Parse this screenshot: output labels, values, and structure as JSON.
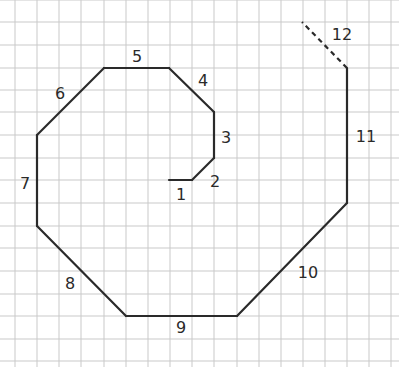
{
  "diagram": {
    "type": "spiral-path-on-grid",
    "grid": {
      "x_lines": [
        15,
        37,
        59,
        81,
        104,
        126,
        148,
        170,
        192,
        214,
        237,
        259,
        281,
        303,
        325,
        347,
        369,
        391
      ],
      "y_lines": [
        0,
        22,
        45,
        68,
        90,
        112,
        135,
        158,
        180,
        203,
        226,
        248,
        271,
        294,
        316,
        339,
        361
      ],
      "color": "#c9c9c9"
    },
    "line_color": "#2a2a2a",
    "segments": [
      {
        "label": "1",
        "from": [
          169,
          180
        ],
        "to": [
          192,
          180
        ],
        "dashed": false,
        "label_pos": [
          181,
          195
        ]
      },
      {
        "label": "2",
        "from": [
          192,
          180
        ],
        "to": [
          214,
          158
        ],
        "dashed": false,
        "label_pos": [
          215,
          182
        ]
      },
      {
        "label": "3",
        "from": [
          214,
          158
        ],
        "to": [
          214,
          112
        ],
        "dashed": false,
        "label_pos": [
          226,
          138
        ]
      },
      {
        "label": "4",
        "from": [
          214,
          112
        ],
        "to": [
          169,
          68
        ],
        "dashed": false,
        "label_pos": [
          203,
          81
        ]
      },
      {
        "label": "5",
        "from": [
          169,
          68
        ],
        "to": [
          104,
          68
        ],
        "dashed": false,
        "label_pos": [
          137,
          57
        ]
      },
      {
        "label": "6",
        "from": [
          104,
          68
        ],
        "to": [
          37,
          135
        ],
        "dashed": false,
        "label_pos": [
          60,
          94
        ]
      },
      {
        "label": "7",
        "from": [
          37,
          135
        ],
        "to": [
          37,
          226
        ],
        "dashed": false,
        "label_pos": [
          25,
          184
        ]
      },
      {
        "label": "8",
        "from": [
          37,
          226
        ],
        "to": [
          126,
          316
        ],
        "dashed": false,
        "label_pos": [
          70,
          284
        ]
      },
      {
        "label": "9",
        "from": [
          126,
          316
        ],
        "to": [
          237,
          316
        ],
        "dashed": false,
        "label_pos": [
          181,
          328
        ]
      },
      {
        "label": "10",
        "from": [
          237,
          316
        ],
        "to": [
          347,
          203
        ],
        "dashed": false,
        "label_pos": [
          308,
          273
        ]
      },
      {
        "label": "11",
        "from": [
          347,
          203
        ],
        "to": [
          347,
          68
        ],
        "dashed": false,
        "label_pos": [
          366,
          137
        ]
      },
      {
        "label": "12",
        "from": [
          347,
          68
        ],
        "to": [
          302,
          22
        ],
        "dashed": true,
        "label_pos": [
          342,
          35
        ]
      }
    ]
  }
}
